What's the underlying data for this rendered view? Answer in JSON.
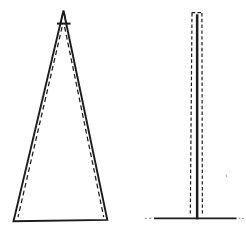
{
  "canvas": {
    "width": 246,
    "height": 233,
    "background": "#ffffff"
  },
  "palette": {
    "ink": "#1c1c1c",
    "faint": "#8f8f8f",
    "speck": "#b5b5b5"
  },
  "diagram": {
    "figures": [
      {
        "name": "tapered-column",
        "elements": [
          {
            "kind": "polygon",
            "name": "tapered-column-outline",
            "points": [
              [
                63.5,
                10.5
              ],
              [
                107.3,
                219.9
              ],
              [
                13.5,
                221.3
              ]
            ],
            "stroke": "ink",
            "width": 1.9
          },
          {
            "kind": "line",
            "name": "apex-crossbar",
            "x1": 57.0,
            "y1": 23.6,
            "x2": 70.5,
            "y2": 23.6,
            "width": 2.1,
            "stroke": "ink"
          },
          {
            "kind": "line",
            "name": "apex-inner-line-left",
            "x1": 62.6,
            "y1": 13.5,
            "x2": 61.0,
            "y2": 22.6,
            "width": 1.2,
            "stroke": "ink"
          },
          {
            "kind": "line",
            "name": "apex-inner-line-right",
            "x1": 64.4,
            "y1": 13.5,
            "x2": 65.9,
            "y2": 22.6,
            "width": 1.2,
            "stroke": "ink"
          },
          {
            "kind": "line",
            "name": "deflection-dashed-left",
            "x1": 62.1,
            "y1": 27.0,
            "x2": 18.0,
            "y2": 217.0,
            "width": 1.25,
            "stroke": "ink",
            "dash": [
              4.8,
              3.2
            ]
          },
          {
            "kind": "line",
            "name": "deflection-dashed-right",
            "x1": 64.6,
            "y1": 27.0,
            "x2": 103.7,
            "y2": 217.0,
            "width": 1.25,
            "stroke": "ink",
            "dash": [
              4.8,
              3.2
            ]
          }
        ]
      },
      {
        "name": "uniform-mast",
        "elements": [
          {
            "kind": "rect",
            "name": "mast-solid-bar",
            "x": 195.9,
            "y": 14.3,
            "w": 2.5,
            "h": 205.0,
            "fill": "ink"
          },
          {
            "kind": "line",
            "name": "mast-dashed-outline-left",
            "x1": 192.0,
            "y1": 13.0,
            "x2": 190.3,
            "y2": 215.6,
            "width": 1.2,
            "stroke": "ink",
            "dash": [
              3.4,
              2.4
            ]
          },
          {
            "kind": "line",
            "name": "mast-dashed-outline-right",
            "x1": 201.9,
            "y1": 13.0,
            "x2": 202.4,
            "y2": 215.6,
            "width": 1.2,
            "stroke": "ink",
            "dash": [
              3.4,
              2.4
            ]
          },
          {
            "kind": "line",
            "name": "mast-dashed-outline-top",
            "x1": 191.6,
            "y1": 12.6,
            "x2": 202.3,
            "y2": 12.6,
            "width": 1.2,
            "stroke": "ink",
            "dash": [
              3.6,
              2.2
            ]
          },
          {
            "kind": "line",
            "name": "ground-line",
            "x1": 154.0,
            "y1": 218.4,
            "x2": 236.5,
            "y2": 218.4,
            "width": 1.8,
            "stroke": "ink"
          },
          {
            "kind": "line",
            "name": "ground-tick-left-1",
            "x1": 144.8,
            "y1": 218.4,
            "x2": 146.6,
            "y2": 218.4,
            "width": 1.1,
            "stroke": "faint"
          },
          {
            "kind": "line",
            "name": "ground-tick-left-2",
            "x1": 149.2,
            "y1": 218.2,
            "x2": 151.4,
            "y2": 218.2,
            "width": 1.1,
            "stroke": "faint"
          },
          {
            "kind": "line",
            "name": "ground-tick-right-1",
            "x1": 238.6,
            "y1": 218.3,
            "x2": 240.2,
            "y2": 218.3,
            "width": 1.1,
            "stroke": "faint"
          },
          {
            "kind": "line",
            "name": "ground-tick-right-2",
            "x1": 242.0,
            "y1": 218.5,
            "x2": 243.6,
            "y2": 218.5,
            "width": 1.1,
            "stroke": "faint"
          },
          {
            "kind": "line",
            "name": "stray-speck",
            "x1": 226.0,
            "y1": 174.5,
            "x2": 226.8,
            "y2": 177.2,
            "width": 1.1,
            "stroke": "speck"
          }
        ]
      }
    ]
  }
}
